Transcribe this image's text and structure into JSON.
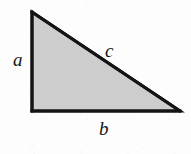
{
  "figure": {
    "name": "right-triangle-diagram",
    "background_color": "#fdfdfd",
    "fill_color": "#cdcdcd",
    "stroke_color": "#141414",
    "stroke_width": 3,
    "vertices": {
      "top_left": {
        "x": 32,
        "y": 12
      },
      "bottom_left": {
        "x": 32,
        "y": 111
      },
      "bottom_right": {
        "x": 180,
        "y": 111
      }
    },
    "right_angle_at": "bottom-left"
  },
  "labels": {
    "leg_vertical": "a",
    "hypotenuse": "c",
    "leg_horizontal": "b"
  }
}
